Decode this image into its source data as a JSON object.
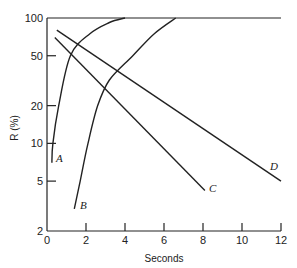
{
  "chart_data": {
    "type": "line",
    "title": "",
    "xlabel": "Seconds",
    "ylabel": "R (%)",
    "xlim": [
      0,
      12
    ],
    "ylim": [
      2,
      100
    ],
    "yscale": "log",
    "grid": false,
    "legend": "none (curves labeled inline)",
    "x_ticks": [
      0,
      2,
      4,
      6,
      8,
      10,
      12
    ],
    "y_ticks": [
      2,
      5,
      10,
      20,
      50,
      100
    ],
    "series": [
      {
        "name": "A",
        "x": [
          0.25,
          0.3,
          0.6,
          1.2,
          2.2,
          3.2,
          4.0
        ],
        "y": [
          7,
          10,
          20,
          50,
          75,
          92,
          100
        ]
      },
      {
        "name": "B",
        "x": [
          1.4,
          1.7,
          2.1,
          2.6,
          3.2,
          4.4,
          5.5,
          6.6
        ],
        "y": [
          3,
          5,
          10,
          20,
          32,
          50,
          75,
          100
        ]
      },
      {
        "name": "C",
        "x": [
          0.4,
          8.1
        ],
        "y": [
          70,
          4.2
        ]
      },
      {
        "name": "D",
        "x": [
          0.5,
          12.0
        ],
        "y": [
          80,
          5.0
        ]
      }
    ]
  },
  "labels": {
    "x_axis_title": "Seconds",
    "y_axis_title": "R  (%)",
    "x_ticks": [
      "0",
      "2",
      "4",
      "6",
      "8",
      "10",
      "12"
    ],
    "y_ticks": [
      "2",
      "5",
      "10",
      "20",
      "50",
      "100"
    ],
    "curve_A": "A",
    "curve_B": "B",
    "curve_C": "C",
    "curve_D": "D"
  },
  "colors": {
    "line": "#222222",
    "background": "#ffffff"
  }
}
